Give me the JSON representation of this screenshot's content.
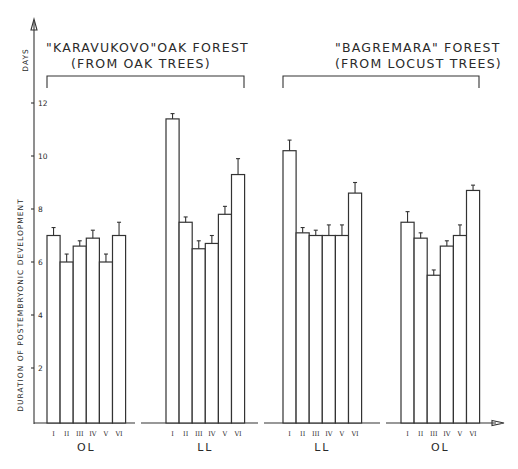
{
  "chart_data": {
    "type": "bar",
    "ylabel": "DURATION OF POSTEMBRYONIC DEVELOPMENT",
    "yunit": "DAYS",
    "yticks": [
      2,
      4,
      6,
      8,
      10,
      12
    ],
    "ylim": [
      0,
      12.5
    ],
    "grid": false,
    "error_bars": true,
    "panels": [
      {
        "title_line1": "\"KARAVUKOVO\"OAK FOREST",
        "title_line2": "(FROM OAK TREES)",
        "groups": [
          {
            "label": "OL",
            "categories": [
              "I",
              "II",
              "III",
              "IV",
              "V",
              "VI"
            ],
            "values": [
              7.0,
              6.0,
              6.6,
              6.9,
              6.0,
              7.0
            ],
            "error_upper": [
              7.3,
              6.3,
              6.8,
              7.2,
              6.3,
              7.5
            ]
          },
          {
            "label": "LL",
            "categories": [
              "I",
              "II",
              "III",
              "IV",
              "V",
              "VI"
            ],
            "values": [
              11.4,
              7.5,
              6.5,
              6.7,
              7.8,
              9.3
            ],
            "error_upper": [
              11.6,
              7.7,
              6.8,
              7.0,
              8.1,
              9.9
            ]
          }
        ]
      },
      {
        "title_line1": "\"BAGREMARA\" FOREST",
        "title_line2": "(FROM LOCUST TREES)",
        "groups": [
          {
            "label": "LL",
            "categories": [
              "I",
              "II",
              "III",
              "IV",
              "V",
              "VI"
            ],
            "values": [
              10.2,
              7.1,
              7.0,
              7.0,
              7.0,
              8.6
            ],
            "error_upper": [
              10.6,
              7.3,
              7.2,
              7.4,
              7.4,
              9.0
            ]
          },
          {
            "label": "OL",
            "categories": [
              "I",
              "II",
              "III",
              "IV",
              "V",
              "VI"
            ],
            "values": [
              7.5,
              6.9,
              5.5,
              6.6,
              7.0,
              8.7
            ],
            "error_upper": [
              7.9,
              7.1,
              5.7,
              6.8,
              7.4,
              8.9
            ]
          }
        ]
      }
    ]
  },
  "layout": {
    "group_x": [
      47,
      166,
      283,
      401
    ],
    "bar_width": 13.1
  }
}
